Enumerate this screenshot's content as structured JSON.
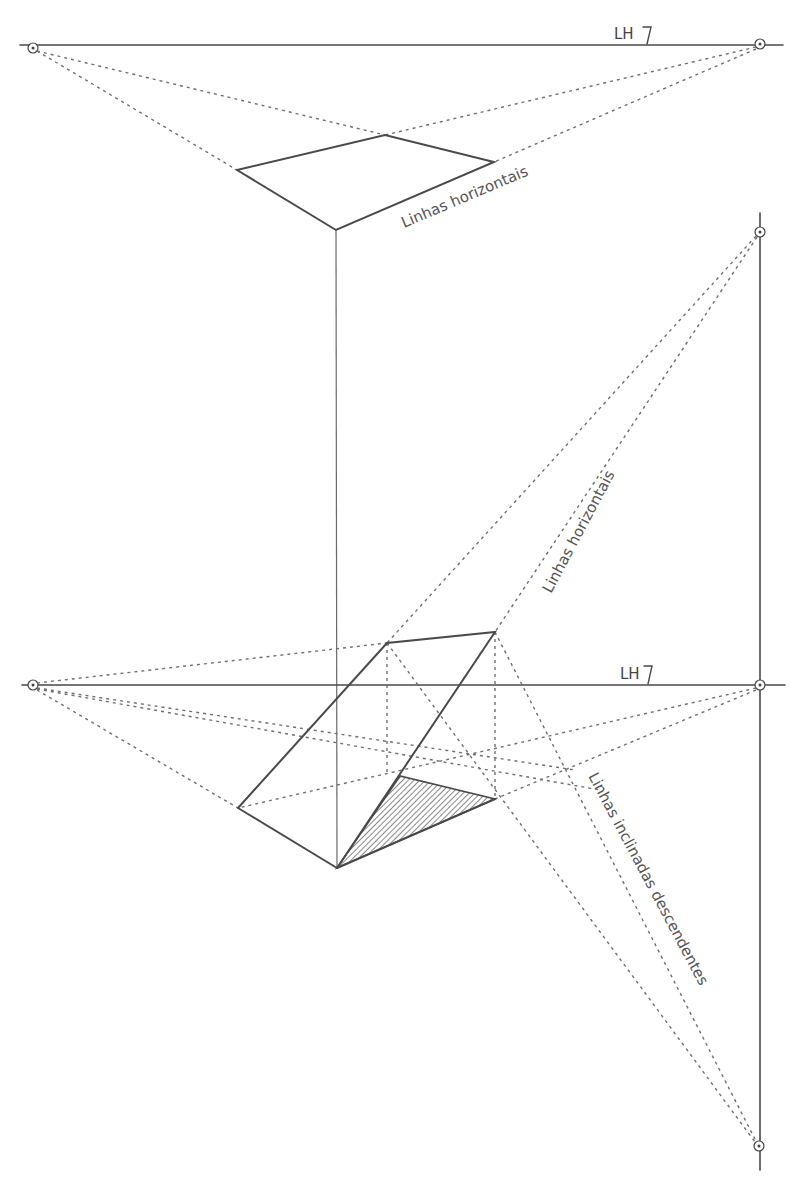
{
  "figure": {
    "type": "perspective-drawing",
    "background": "#ffffff",
    "stroke_color": "#4a4a4a",
    "upper_diagram": {
      "horizon_label": "LH",
      "horizon_y": 45,
      "vanishing_points": [
        {
          "name": "left",
          "x": 33,
          "y": 45
        },
        {
          "name": "right",
          "x": 760,
          "y": 45
        }
      ],
      "shape_vertices": {
        "left": [
          237,
          170
        ],
        "top": [
          385,
          135
        ],
        "right": [
          494,
          162
        ],
        "bottom": [
          336,
          230
        ]
      },
      "annotation": "Linhas horizontais"
    },
    "lower_diagram": {
      "horizon_label": "LH",
      "horizon_y": 685,
      "vanishing_points": [
        {
          "name": "left",
          "x": 33,
          "y": 685
        },
        {
          "name": "right",
          "x": 760,
          "y": 685
        },
        {
          "name": "upper-vertical",
          "x": 760,
          "y": 232
        },
        {
          "name": "lower-vertical",
          "x": 759,
          "y": 1146
        }
      ],
      "shape_vertices": {
        "A_top_left": [
          387,
          643
        ],
        "B_top_right": [
          495,
          632
        ],
        "C_left": [
          238,
          808
        ],
        "D_bottom": [
          337,
          868
        ],
        "E_right": [
          495,
          799
        ],
        "F_shade_top": [
          400,
          776
        ]
      },
      "annotations": [
        "Linhas horizontais",
        "Linhas inclinadas descendentes"
      ],
      "shaded_face": "triangle D-F-E (hatched)"
    }
  },
  "labels": {
    "lh_top": "LH",
    "lh_bottom": "LH",
    "horizontal_lines_top": "Linhas horizontais",
    "horizontal_lines_mid": "Linhas horizontais",
    "descending_lines": "Linhas inclinadas descendentes"
  }
}
